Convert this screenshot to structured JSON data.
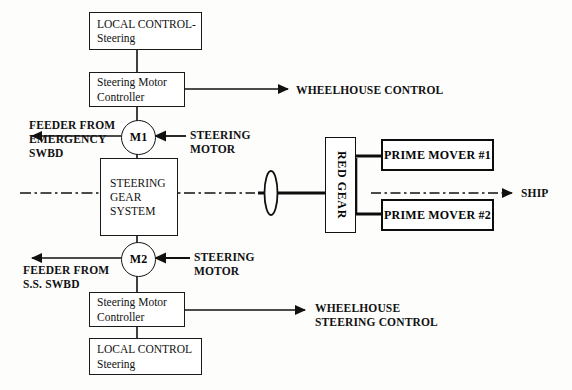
{
  "diagram": {
    "colors": {
      "stroke": "#111111",
      "heavy_stroke": "#0d0d0d",
      "background": "#fdfdfc",
      "text": "#111111"
    },
    "boxes": {
      "local_control_top": {
        "line1": "LOCAL CONTROL-",
        "line2": "Steering"
      },
      "steering_motor_controller_top": {
        "line1": "Steering Motor",
        "line2": "Controller"
      },
      "steering_gear_system": {
        "line1": "STEERING",
        "line2": "GEAR",
        "line3": "SYSTEM"
      },
      "steering_motor_controller_bottom": {
        "line1": "Steering Motor",
        "line2": "Controller"
      },
      "local_control_bottom": {
        "line1": "LOCAL CONTROL",
        "line2": "Steering"
      },
      "red_gear": {
        "label": "RED GEAR"
      },
      "prime_mover_1": {
        "label": "PRIME MOVER #1"
      },
      "prime_mover_2": {
        "label": "PRIME MOVER #2"
      }
    },
    "motors": {
      "m1": {
        "label": "M1"
      },
      "m2": {
        "label": "M2"
      }
    },
    "labels": {
      "feeder_emergency": {
        "line1": "FEEDER FROM",
        "line2": "EMERGENCY",
        "line3": "SWBD"
      },
      "feeder_ss": {
        "line1": "FEEDER FROM",
        "line2": "S.S. SWBD"
      },
      "steering_motor_top": {
        "line1": "STEERING",
        "line2": "MOTOR"
      },
      "steering_motor_bottom": {
        "line1": "STEERING",
        "line2": "MOTOR"
      },
      "wheelhouse_control": {
        "line1": "WHEELHOUSE  CONTROL"
      },
      "wheelhouse_steering_control": {
        "line1": "WHEELHOUSE",
        "line2": "STEERING  CONTROL"
      },
      "ship": {
        "line1": "SHIP"
      }
    }
  }
}
